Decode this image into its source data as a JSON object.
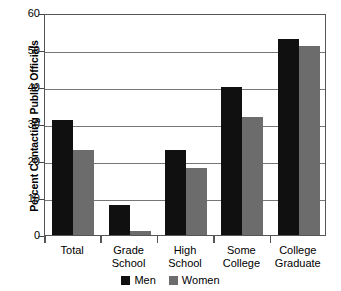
{
  "chart_data": {
    "type": "bar",
    "title": "",
    "xlabel": "",
    "ylabel": "Percent Contacting Public Officials",
    "categories": [
      "Total",
      "Grade School",
      "High School",
      "Some College",
      "College Graduate"
    ],
    "category_lines": [
      [
        "Total",
        ""
      ],
      [
        "Grade",
        "School"
      ],
      [
        "High",
        "School"
      ],
      [
        "Some",
        "College"
      ],
      [
        "College",
        "Graduate"
      ]
    ],
    "series": [
      {
        "name": "Men",
        "color": "#101010",
        "values": [
          31,
          8,
          23,
          40,
          53
        ]
      },
      {
        "name": "Women",
        "color": "#6c6c6c",
        "values": [
          23,
          1,
          18,
          32,
          51
        ]
      }
    ],
    "ylim": [
      0,
      60
    ],
    "yticks": [
      0,
      10,
      20,
      30,
      40,
      50,
      60
    ],
    "ytick_labels": [
      "0",
      "10",
      "20",
      "30",
      "40",
      "50",
      "60"
    ],
    "grid": true,
    "legend_position": "bottom-center"
  },
  "legend": {
    "items": [
      {
        "label": "Men"
      },
      {
        "label": "Women"
      }
    ]
  }
}
